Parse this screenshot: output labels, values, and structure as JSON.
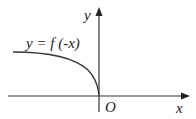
{
  "diagram": {
    "curve_label": "y = f (-x)",
    "x_axis_label": "x",
    "y_axis_label": "y",
    "origin_label": "O"
  }
}
